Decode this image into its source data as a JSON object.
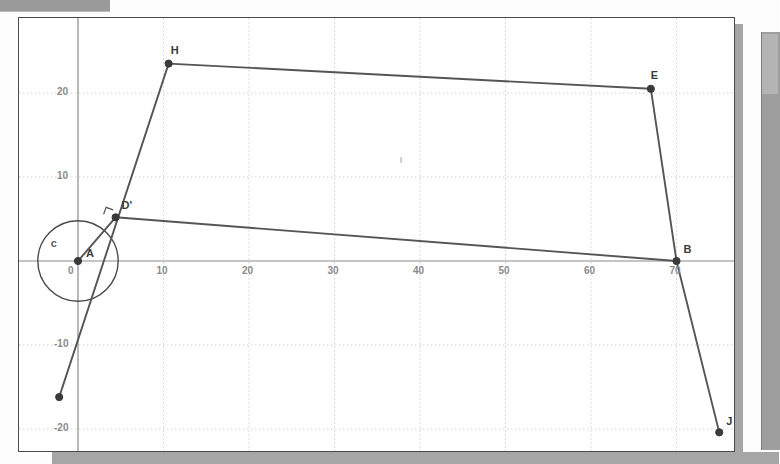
{
  "window": {
    "titlebar_label": "",
    "has_right_scrollbar": true
  },
  "colors": {
    "plot_background": "#ffffff",
    "plot_border": "#4a4a4a",
    "axis": "#8a8a8a",
    "gridline": "#cfcfcf",
    "segment": "#555555",
    "point": "#3a3a3a",
    "circle": "#4a4a4a",
    "chrome_gray": "#9e9e9e"
  },
  "chart_data": {
    "type": "scatter",
    "title": "",
    "xlabel": "",
    "ylabel": "",
    "xlim": [
      -7,
      77
    ],
    "ylim": [
      -28,
      28
    ],
    "grid": true,
    "legend": "none",
    "x_ticks": [
      0,
      10,
      20,
      30,
      40,
      50,
      60,
      70
    ],
    "x_tick_labels": [
      "0",
      "10",
      "20",
      "30",
      "40",
      "50",
      "60",
      "70"
    ],
    "y_ticks": [
      20,
      10,
      -10,
      -20
    ],
    "y_tick_labels": [
      "20",
      "10",
      "-10",
      "-20"
    ],
    "points": [
      {
        "name": "A",
        "label": "A",
        "x": 0.0,
        "y": 0.0,
        "label_dx": 8,
        "label_dy": -14,
        "faint": false
      },
      {
        "name": "Dp",
        "label": "D'",
        "x": 4.4,
        "y": 5.2,
        "label_dx": 6,
        "label_dy": -18,
        "faint": false
      },
      {
        "name": "H",
        "label": "H",
        "x": 10.6,
        "y": 23.5,
        "label_dx": 2,
        "label_dy": -20,
        "faint": false
      },
      {
        "name": "E",
        "label": "E",
        "x": 67.0,
        "y": 20.5,
        "label_dx": 0,
        "label_dy": -20,
        "faint": false
      },
      {
        "name": "B",
        "label": "B",
        "x": 70.0,
        "y": 0.0,
        "label_dx": 7,
        "label_dy": -18,
        "faint": false
      },
      {
        "name": "J",
        "label": "J",
        "x": 75.0,
        "y": -20.4,
        "label_dx": 7,
        "label_dy": -17,
        "faint": false
      },
      {
        "name": "K",
        "label": "",
        "x": -2.2,
        "y": -16.2,
        "label_dx": 0,
        "label_dy": 0,
        "faint": false
      },
      {
        "name": "I",
        "label": "I",
        "x": 37.5,
        "y": 12.8,
        "label_dx": 1,
        "label_dy": 2,
        "faint": true
      }
    ],
    "segments": [
      {
        "name": "H-E",
        "from": [
          10.6,
          23.5
        ],
        "to": [
          67.0,
          20.5
        ]
      },
      {
        "name": "E-B",
        "from": [
          67.0,
          20.5
        ],
        "to": [
          70.0,
          0.0
        ]
      },
      {
        "name": "B-J",
        "from": [
          70.0,
          0.0
        ],
        "to": [
          75.0,
          -20.4
        ]
      },
      {
        "name": "B-Dp",
        "from": [
          70.0,
          0.0
        ],
        "to": [
          4.4,
          5.2
        ]
      },
      {
        "name": "H-K",
        "from": [
          10.6,
          23.5
        ],
        "to": [
          -2.2,
          -16.2
        ]
      },
      {
        "name": "A-Dp",
        "from": [
          0.0,
          0.0
        ],
        "to": [
          4.4,
          5.2
        ]
      }
    ],
    "circles": [
      {
        "name": "c",
        "label": "c",
        "cx": 0.0,
        "cy": 0.0,
        "r": 4.7,
        "label_x": -3.2,
        "label_y": 2.9
      }
    ],
    "angle_markers": [
      {
        "name": "right-angle-at-Dp",
        "x": 4.4,
        "y": 5.2
      }
    ]
  }
}
